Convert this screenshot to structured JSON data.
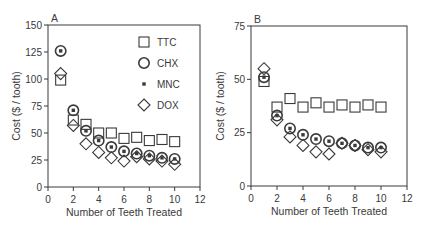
{
  "chart_data": [
    {
      "type": "scatter",
      "panel_label": "A",
      "title": "",
      "xlabel": "Number of Teeth Treated",
      "ylabel": "Cost ($ / tooth)",
      "xlim": [
        0,
        12
      ],
      "ylim": [
        0,
        150
      ],
      "xticks": [
        0,
        2,
        4,
        6,
        8,
        10,
        12
      ],
      "yticks": [
        0,
        25,
        50,
        75,
        100,
        125,
        150
      ],
      "grid": false,
      "legend_position": "upper right inside",
      "x": [
        1,
        2,
        3,
        4,
        5,
        6,
        7,
        8,
        9,
        10
      ],
      "series": [
        {
          "name": "TTC",
          "marker": "square",
          "values": [
            99,
            62,
            58,
            50,
            50,
            45,
            46,
            43,
            44,
            42
          ]
        },
        {
          "name": "CHX",
          "marker": "circle",
          "values": [
            126,
            71,
            52,
            43,
            37,
            33,
            31,
            29,
            27,
            26
          ]
        },
        {
          "name": "MNC",
          "marker": "small-filled-square",
          "values": [
            126,
            71,
            52,
            43,
            37,
            33,
            31,
            29,
            27,
            26
          ]
        },
        {
          "name": "DOX",
          "marker": "diamond",
          "values": [
            105,
            57,
            40,
            32,
            27,
            24,
            28,
            26,
            24,
            21
          ]
        }
      ]
    },
    {
      "type": "scatter",
      "panel_label": "B",
      "title": "",
      "xlabel": "Number of Teeth Treated",
      "ylabel": "Cost ($ / tooth)",
      "xlim": [
        0,
        12
      ],
      "ylim": [
        0,
        75
      ],
      "xticks": [
        0,
        2,
        4,
        6,
        8,
        10,
        12
      ],
      "yticks": [
        0,
        25,
        50,
        75
      ],
      "grid": false,
      "legend_position": "none",
      "x": [
        1,
        2,
        3,
        4,
        5,
        6,
        7,
        8,
        9,
        10
      ],
      "series": [
        {
          "name": "TTC",
          "marker": "square",
          "values": [
            49,
            37,
            41,
            37,
            39,
            37,
            38,
            37,
            38,
            37
          ]
        },
        {
          "name": "CHX",
          "marker": "circle",
          "values": [
            51,
            33,
            27,
            24,
            22,
            21,
            20,
            19,
            18,
            18
          ]
        },
        {
          "name": "MNC",
          "marker": "small-filled-square",
          "values": [
            51,
            33,
            27,
            24,
            22,
            21,
            20,
            19,
            18,
            18
          ]
        },
        {
          "name": "DOX",
          "marker": "diamond",
          "values": [
            55,
            31,
            23,
            19,
            16,
            15,
            20,
            19,
            17,
            16
          ]
        }
      ]
    }
  ],
  "colors": {
    "ink": "#3a3a3a",
    "background": "#ffffff"
  }
}
